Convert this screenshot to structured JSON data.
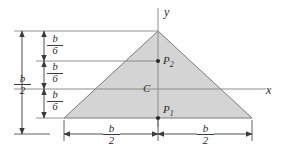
{
  "figure": {
    "type": "geometry-diagram",
    "colors": {
      "fill": "#d4d4d4",
      "stroke": "#6e6e6e",
      "axis": "#9a9a9a",
      "dimension": "#3a3a3a",
      "text": "#2b2b2b",
      "background": "#ffffff"
    }
  },
  "axes": {
    "y_label": "y",
    "x_label": "x"
  },
  "points": [
    {
      "id": "P2",
      "base": "P",
      "sub": "2"
    },
    {
      "id": "C",
      "base": "C",
      "sub": ""
    },
    {
      "id": "P1",
      "base": "P",
      "sub": "1"
    }
  ],
  "dimensions": {
    "left_overall": {
      "num": "b",
      "den": "2"
    },
    "left_seg_top": {
      "num": "b",
      "den": "6"
    },
    "left_seg_mid": {
      "num": "b",
      "den": "6"
    },
    "left_seg_bot": {
      "num": "b",
      "den": "6"
    },
    "bottom_left": {
      "num": "b",
      "den": "2"
    },
    "bottom_right": {
      "num": "b",
      "den": "2"
    }
  },
  "geometry": {
    "apex": [
      158,
      31
    ],
    "left_vertex": [
      64,
      118
    ],
    "right_vertex": [
      252,
      118
    ],
    "y_axis_x": 158,
    "x_axis_y": 89,
    "p2_y": 61,
    "p1_y": 118
  }
}
